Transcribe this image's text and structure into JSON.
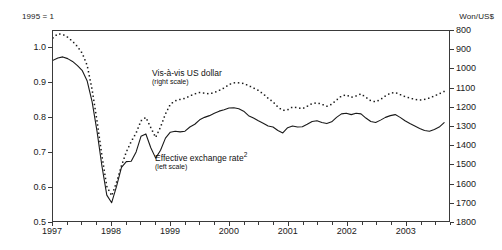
{
  "figure": {
    "left_unit_label": "1995 = 1",
    "right_unit_label": "Won/US$"
  },
  "annotations": {
    "dotted": {
      "title": "Vis-à-vis US dollar",
      "scale_note": "(right scale)"
    },
    "solid": {
      "title": "Effective exchange rate",
      "footnote_marker": "2",
      "scale_note": "(left scale)"
    }
  },
  "axes": {
    "left": {
      "label": "1995 = 1",
      "ticks": [
        "1.0",
        "0.9",
        "0.8",
        "0.7",
        "0.6",
        "0.5"
      ],
      "values": [
        1.0,
        0.9,
        0.8,
        0.7,
        0.6,
        0.5
      ],
      "min": 0.5,
      "max": 1.05
    },
    "right": {
      "label": "Won/US$",
      "ticks": [
        "800",
        "900",
        "1000",
        "1100",
        "1200",
        "1300",
        "1400",
        "1500",
        "1600",
        "1700",
        "1800"
      ],
      "values": [
        800,
        900,
        1000,
        1100,
        1200,
        1300,
        1400,
        1500,
        1600,
        1700,
        1800
      ],
      "min": 800,
      "max": 1800,
      "inverted": true
    },
    "bottom": {
      "ticks": [
        "1997",
        "1998",
        "1999",
        "2000",
        "2001",
        "2002",
        "2003"
      ],
      "values": [
        1997,
        1998,
        1999,
        2000,
        2001,
        2002,
        2003
      ],
      "min": 1997.0,
      "max": 2003.75
    }
  },
  "chart_data": {
    "type": "line",
    "title": "",
    "subtitle": "",
    "xlabel": "",
    "ylabel": "1995 = 1",
    "y2label": "Won/US$",
    "xlim": [
      1997.0,
      2003.75
    ],
    "ylim": [
      0.5,
      1.05
    ],
    "y2lim": [
      1800,
      800
    ],
    "y2_inverted": true,
    "grid": false,
    "legend_position": "inline-annotations",
    "x": [
      1997.0,
      1997.083,
      1997.167,
      1997.25,
      1997.333,
      1997.417,
      1997.5,
      1997.583,
      1997.667,
      1997.75,
      1997.833,
      1997.917,
      1998.0,
      1998.083,
      1998.167,
      1998.25,
      1998.333,
      1998.417,
      1998.5,
      1998.583,
      1998.667,
      1998.75,
      1998.833,
      1998.917,
      1999.0,
      1999.083,
      1999.167,
      1999.25,
      1999.333,
      1999.417,
      1999.5,
      1999.583,
      1999.667,
      1999.75,
      1999.833,
      1999.917,
      2000.0,
      2000.083,
      2000.167,
      2000.25,
      2000.333,
      2000.417,
      2000.5,
      2000.583,
      2000.667,
      2000.75,
      2000.833,
      2000.917,
      2001.0,
      2001.083,
      2001.167,
      2001.25,
      2001.333,
      2001.417,
      2001.5,
      2001.583,
      2001.667,
      2001.75,
      2001.833,
      2001.917,
      2002.0,
      2002.083,
      2002.167,
      2002.25,
      2002.333,
      2002.417,
      2002.5,
      2002.583,
      2002.667,
      2002.75,
      2002.833,
      2002.917,
      2003.0,
      2003.083,
      2003.167,
      2003.25,
      2003.333,
      2003.417,
      2003.5,
      2003.583,
      2003.667
    ],
    "series": [
      {
        "name": "Effective exchange rate",
        "scale": "left",
        "style": "solid",
        "color": "#1a1a1a",
        "note": "(left scale)",
        "values": [
          0.965,
          0.972,
          0.975,
          0.97,
          0.962,
          0.95,
          0.935,
          0.905,
          0.845,
          0.76,
          0.66,
          0.575,
          0.553,
          0.6,
          0.655,
          0.672,
          0.673,
          0.7,
          0.745,
          0.752,
          0.712,
          0.682,
          0.705,
          0.74,
          0.757,
          0.76,
          0.758,
          0.76,
          0.772,
          0.78,
          0.793,
          0.8,
          0.805,
          0.812,
          0.818,
          0.822,
          0.827,
          0.828,
          0.825,
          0.818,
          0.805,
          0.798,
          0.79,
          0.783,
          0.775,
          0.772,
          0.762,
          0.755,
          0.77,
          0.775,
          0.772,
          0.773,
          0.78,
          0.788,
          0.79,
          0.785,
          0.782,
          0.787,
          0.8,
          0.81,
          0.812,
          0.808,
          0.812,
          0.81,
          0.798,
          0.788,
          0.785,
          0.792,
          0.8,
          0.805,
          0.808,
          0.8,
          0.79,
          0.782,
          0.775,
          0.768,
          0.762,
          0.76,
          0.765,
          0.772,
          0.785
        ]
      },
      {
        "name": "Vis-à-vis US dollar",
        "scale": "right",
        "style": "dotted",
        "color": "#1a1a1a",
        "note": "(right scale)",
        "values": [
          1.03,
          1.042,
          1.04,
          1.032,
          1.02,
          1.005,
          0.985,
          0.95,
          0.88,
          0.79,
          0.69,
          0.6,
          0.573,
          0.612,
          0.66,
          0.7,
          0.73,
          0.755,
          0.79,
          0.8,
          0.77,
          0.742,
          0.772,
          0.81,
          0.838,
          0.848,
          0.852,
          0.855,
          0.862,
          0.868,
          0.872,
          0.87,
          0.868,
          0.872,
          0.878,
          0.885,
          0.895,
          0.9,
          0.9,
          0.898,
          0.892,
          0.885,
          0.878,
          0.868,
          0.855,
          0.845,
          0.83,
          0.82,
          0.822,
          0.83,
          0.828,
          0.825,
          0.832,
          0.84,
          0.842,
          0.838,
          0.832,
          0.838,
          0.85,
          0.862,
          0.865,
          0.858,
          0.862,
          0.868,
          0.858,
          0.848,
          0.845,
          0.852,
          0.862,
          0.87,
          0.872,
          0.866,
          0.86,
          0.856,
          0.852,
          0.85,
          0.852,
          0.856,
          0.862,
          0.868,
          0.875
        ]
      }
    ]
  }
}
